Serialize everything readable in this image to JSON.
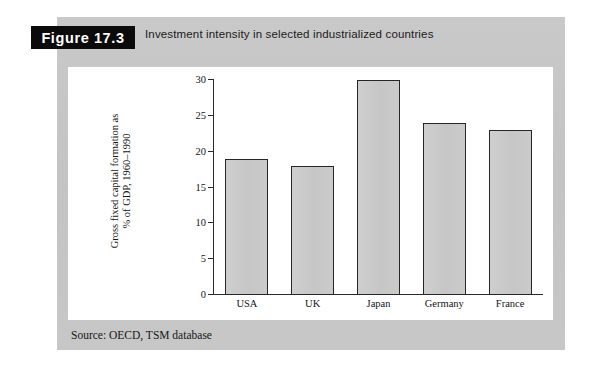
{
  "figure": {
    "tag_label": "Figure 17.3",
    "caption": "Investment intensity in selected industrialized countries",
    "source": "Source: OECD, TSM database"
  },
  "colors": {
    "panel_background": "#c6c6c6",
    "canvas_background": "#ffffff",
    "tag_background": "#0b0b0b",
    "tag_text": "#ffffff",
    "bar_fill": "#c9c9c9",
    "bar_border": "#262626",
    "axis": "#2a2a2a",
    "text": "#141414"
  },
  "chart_data": {
    "type": "bar",
    "title": "Investment intensity in selected industrialized countries",
    "categories": [
      "USA",
      "UK",
      "Japan",
      "Germany",
      "France"
    ],
    "values": [
      19,
      18,
      30,
      24,
      23
    ],
    "xlabel": "",
    "ylabel_line1": "Gross fixed capital formation as",
    "ylabel_line2": "% of GDP, 1960–1990",
    "ylim": [
      0,
      30
    ],
    "yticks": [
      0,
      5,
      10,
      15,
      20,
      25,
      30
    ],
    "ytick_labels": [
      "0",
      "5",
      "10",
      "15",
      "20",
      "25",
      "30"
    ],
    "grid": false,
    "legend": false,
    "source": "Source: OECD, TSM database"
  }
}
